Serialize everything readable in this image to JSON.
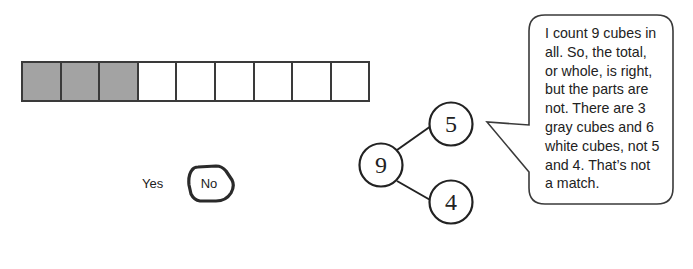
{
  "cube_bar": {
    "total": 9,
    "cubes": [
      {
        "color": "gray"
      },
      {
        "color": "gray"
      },
      {
        "color": "gray"
      },
      {
        "color": "white"
      },
      {
        "color": "white"
      },
      {
        "color": "white"
      },
      {
        "color": "white"
      },
      {
        "color": "white"
      },
      {
        "color": "white"
      }
    ],
    "gray_fill": "#a3a3a3",
    "white_fill": "#ffffff",
    "border_color": "#3a3a3a"
  },
  "choices": {
    "yes_label": "Yes",
    "no_label": "No",
    "selected": "No"
  },
  "number_bond": {
    "whole": "9",
    "part_top": "5",
    "part_bottom": "4"
  },
  "speech_bubble": {
    "lines": [
      "I count 9 cubes in",
      "all.  So, the total,",
      "or whole, is right,",
      "but the parts are",
      "not.  There are 3",
      "gray cubes and 6",
      "white cubes, not 5",
      "and 4.  That’s not",
      "a match."
    ]
  }
}
